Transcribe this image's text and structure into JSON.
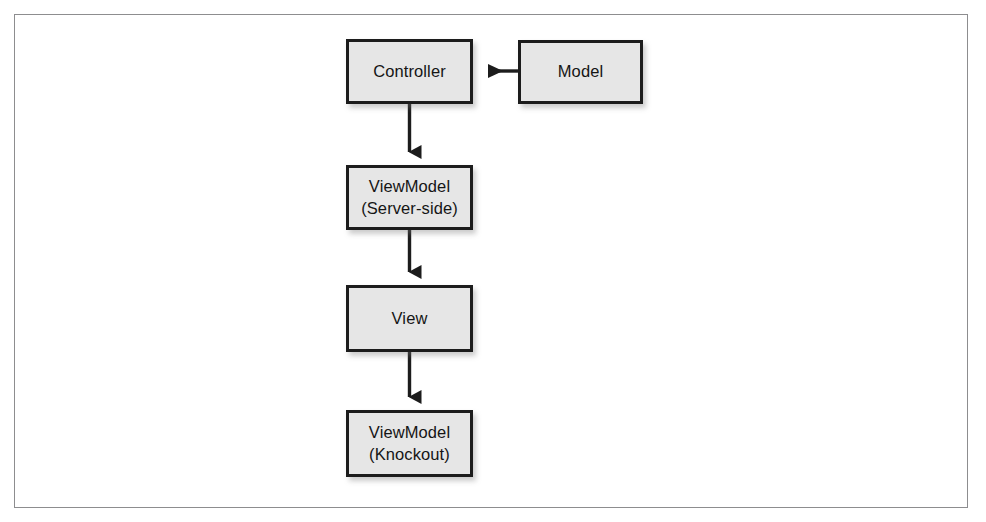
{
  "figure": {
    "type": "flow-diagram",
    "background_color": "#ffffff",
    "frame_border_color": "#8d8d8f",
    "node_fill_color": "#e6e6e6",
    "node_border_color": "#1c1c1c",
    "connector_color": "#1c1c1c"
  },
  "nodes": [
    {
      "id": "controller",
      "lines": [
        "Controller"
      ],
      "line1": "Controller",
      "line2": ""
    },
    {
      "id": "model",
      "lines": [
        "Model"
      ],
      "line1": "Model",
      "line2": ""
    },
    {
      "id": "viewmodel_server",
      "lines": [
        "ViewModel",
        "(Server-side)"
      ],
      "line1": "ViewModel",
      "line2": "(Server-side)"
    },
    {
      "id": "view",
      "lines": [
        "View"
      ],
      "line1": "View",
      "line2": ""
    },
    {
      "id": "viewmodel_knockout",
      "lines": [
        "ViewModel",
        "(Knockout)"
      ],
      "line1": "ViewModel",
      "line2": "(Knockout)"
    }
  ],
  "edges": [
    {
      "id": "model-to-controller",
      "from": "model",
      "to": "controller",
      "direction": "left",
      "label": ""
    },
    {
      "id": "controller-to-viewmodel-server",
      "from": "controller",
      "to": "viewmodel_server",
      "direction": "down",
      "label": ""
    },
    {
      "id": "viewmodel-server-to-view",
      "from": "viewmodel_server",
      "to": "view",
      "direction": "down",
      "label": ""
    },
    {
      "id": "view-to-viewmodel-knockout",
      "from": "view",
      "to": "viewmodel_knockout",
      "direction": "down",
      "label": ""
    }
  ]
}
